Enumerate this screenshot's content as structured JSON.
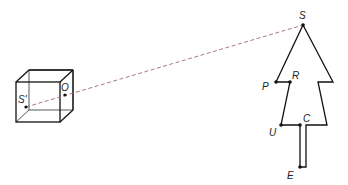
{
  "diagram": {
    "labels": {
      "S": "S",
      "S_prime": "S'",
      "O": "O",
      "P": "P",
      "R": "R",
      "U": "U",
      "C": "C",
      "E": "E"
    },
    "colors": {
      "line": "#111111",
      "ray": "#a06a6a",
      "point": "#111111"
    }
  }
}
